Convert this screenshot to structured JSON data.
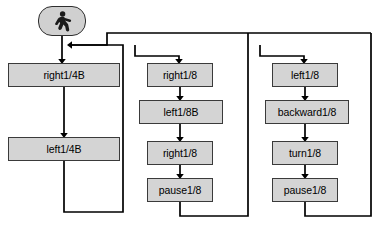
{
  "diagram": {
    "type": "flowchart",
    "background_color": "#ffffff",
    "node_fill_color": "#d4d4d4",
    "node_border_color": "#3a3a3a",
    "edge_color": "#000000",
    "start_node": {
      "icon": "walking-person-icon",
      "shape": "rounded-rectangle",
      "x": 38,
      "y": 6,
      "w": 48,
      "h": 30
    },
    "columns": [
      {
        "name": "left-branch",
        "nodes": [
          {
            "id": "n1",
            "label": "right1/4B",
            "x": 8,
            "y": 63,
            "w": 112,
            "h": 24
          },
          {
            "id": "n2",
            "label": "left1/4B",
            "x": 8,
            "y": 137,
            "w": 112,
            "h": 24
          }
        ]
      },
      {
        "name": "middle-branch",
        "nodes": [
          {
            "id": "n3",
            "label": "right1/8",
            "x": 147,
            "y": 63,
            "w": 66,
            "h": 24
          },
          {
            "id": "n4",
            "label": "left1/8B",
            "x": 139,
            "y": 100,
            "w": 84,
            "h": 24
          },
          {
            "id": "n5",
            "label": "right1/8",
            "x": 147,
            "y": 141,
            "w": 66,
            "h": 24
          },
          {
            "id": "n6",
            "label": "pause1/8",
            "x": 147,
            "y": 178,
            "w": 66,
            "h": 24
          }
        ]
      },
      {
        "name": "right-branch",
        "nodes": [
          {
            "id": "n7",
            "label": "left1/8",
            "x": 272,
            "y": 63,
            "w": 66,
            "h": 24
          },
          {
            "id": "n8",
            "label": "backward1/8",
            "x": 265,
            "y": 100,
            "w": 84,
            "h": 24
          },
          {
            "id": "n9",
            "label": "turn1/8",
            "x": 272,
            "y": 141,
            "w": 66,
            "h": 24
          },
          {
            "id": "n10",
            "label": "pause1/8",
            "x": 272,
            "y": 178,
            "w": 66,
            "h": 24
          }
        ]
      }
    ],
    "edges": [
      {
        "from": "start",
        "to": "n1",
        "kind": "vertical-arrow"
      },
      {
        "from": "n1",
        "to": "n2",
        "kind": "vertical-arrow"
      },
      {
        "from": "n2",
        "to": "join",
        "kind": "return-loop-left"
      },
      {
        "from": "join",
        "to": "n3",
        "kind": "branch-down"
      },
      {
        "from": "n3",
        "to": "n4",
        "kind": "vertical-arrow"
      },
      {
        "from": "n4",
        "to": "n5",
        "kind": "vertical-arrow"
      },
      {
        "from": "n5",
        "to": "n6",
        "kind": "vertical-arrow"
      },
      {
        "from": "n6",
        "to": "join",
        "kind": "return-loop-middle"
      },
      {
        "from": "join",
        "to": "n7",
        "kind": "branch-down"
      },
      {
        "from": "n7",
        "to": "n8",
        "kind": "vertical-arrow"
      },
      {
        "from": "n8",
        "to": "n9",
        "kind": "vertical-arrow"
      },
      {
        "from": "n9",
        "to": "n10",
        "kind": "vertical-arrow"
      },
      {
        "from": "n10",
        "to": "join",
        "kind": "return-loop-right"
      }
    ]
  }
}
